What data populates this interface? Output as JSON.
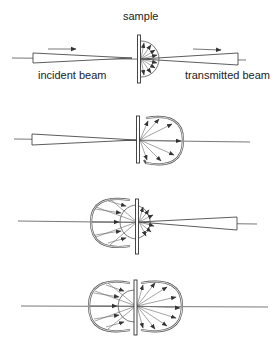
{
  "labels": {
    "sample": "sample",
    "incident": "incident beam",
    "transmitted": "transmitted beam"
  },
  "panels": [
    {
      "id": 1,
      "description": "incident beam through sample, hemispherical backscatter on transmitted side with transmitted beam"
    },
    {
      "id": 2,
      "description": "forward scattering lobe only, no transmitted beam"
    },
    {
      "id": 3,
      "description": "backward scattering lobe plus small forward lobe with transmitted beam"
    },
    {
      "id": 4,
      "description": "symmetric forward and backward scattering lobes"
    }
  ],
  "colors": {
    "line": "#555555",
    "text": "#222222",
    "background": "#ffffff"
  }
}
